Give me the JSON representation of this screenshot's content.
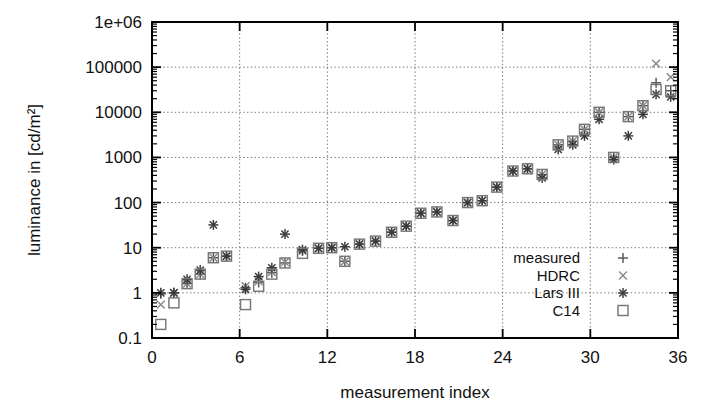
{
  "chart_data": {
    "type": "scatter",
    "title": "",
    "xlabel": "measurement index",
    "ylabel": "luminance in [cd/m²]",
    "xlim": [
      0,
      36
    ],
    "ylim": [
      0.1,
      1000000
    ],
    "yscale": "log",
    "xscale": "linear",
    "xticks": [
      0,
      6,
      12,
      18,
      24,
      30,
      36
    ],
    "xticklabels": [
      "0",
      "6",
      "12",
      "18",
      "24",
      "30",
      "36"
    ],
    "yticks": [
      0.1,
      1,
      10,
      100,
      1000,
      10000,
      100000,
      1000000
    ],
    "yticklabels": [
      "0.1",
      "1",
      "10",
      "100",
      "1000",
      "10000",
      "100000",
      "1e+06"
    ],
    "grid": true,
    "grid_style": "dotted",
    "legend_position": "lower-right-inside",
    "series": [
      {
        "name": "measured",
        "marker": "plus",
        "color": "#555555",
        "x": [
          0.6,
          1.5,
          2.4,
          3.3,
          4.2,
          5.1,
          6.4,
          7.3,
          8.2,
          9.1,
          10.3,
          11.4,
          12.3,
          13.2,
          14.2,
          15.3,
          16.4,
          17.4,
          18.4,
          19.5,
          20.6,
          21.6,
          22.6,
          23.6,
          24.7,
          25.7,
          26.7,
          27.8,
          28.8,
          29.6,
          30.6,
          31.6,
          32.6,
          33.6,
          34.5,
          35.5
        ],
        "y": [
          0.95,
          1.0,
          1.6,
          2.6,
          6.0,
          6.5,
          1.3,
          1.7,
          2.8,
          4.6,
          8.5,
          9.7,
          10.0,
          5.0,
          12.0,
          14.0,
          22.0,
          30.0,
          58.0,
          62.0,
          40.0,
          100.0,
          110.0,
          220.0,
          500.0,
          560.0,
          420.0,
          1900.0,
          2300.0,
          4200.0,
          10000.0,
          1000.0,
          8000.0,
          14000.0,
          45000.0,
          30000.0
        ]
      },
      {
        "name": "HDRC",
        "marker": "cross",
        "color": "#8a8a8a",
        "x": [
          0.6,
          1.5,
          2.4,
          3.3,
          4.2,
          5.1,
          6.4,
          7.3,
          8.2,
          9.1,
          10.3,
          11.4,
          12.3,
          13.2,
          14.2,
          15.3,
          16.4,
          17.4,
          18.4,
          19.5,
          20.6,
          21.6,
          22.6,
          23.6,
          24.7,
          25.7,
          26.7,
          27.8,
          28.8,
          29.6,
          30.6,
          31.6,
          32.6,
          33.6,
          34.5,
          35.5
        ],
        "y": [
          0.55,
          1.0,
          1.6,
          2.6,
          6.0,
          6.5,
          1.4,
          1.8,
          2.9,
          4.8,
          8.5,
          9.7,
          10.0,
          5.0,
          12.0,
          14.0,
          22.0,
          30.0,
          58.0,
          62.0,
          40.0,
          100.0,
          110.0,
          220.0,
          500.0,
          560.0,
          420.0,
          1900.0,
          2300.0,
          4200.0,
          10000.0,
          1000.0,
          8000.0,
          14000.0,
          120000.0,
          60000.0
        ]
      },
      {
        "name": "Lars III",
        "marker": "star",
        "color": "#3a3a3a",
        "x": [
          0.6,
          1.5,
          2.4,
          3.3,
          4.2,
          5.1,
          6.4,
          7.3,
          8.2,
          9.1,
          10.3,
          11.4,
          12.3,
          13.2,
          14.2,
          15.3,
          16.4,
          17.4,
          18.4,
          19.5,
          20.6,
          21.6,
          22.6,
          23.6,
          24.7,
          25.7,
          26.7,
          27.8,
          28.8,
          29.6,
          30.6,
          31.6,
          32.6,
          33.6,
          34.5,
          35.5
        ],
        "y": [
          1.0,
          1.0,
          2.0,
          3.2,
          32.0,
          6.5,
          1.2,
          2.3,
          3.6,
          20.0,
          9.0,
          9.7,
          10.0,
          10.5,
          12.0,
          14.0,
          22.0,
          30.0,
          58.0,
          62.0,
          40.0,
          100.0,
          110.0,
          220.0,
          500.0,
          560.0,
          350.0,
          1500.0,
          1900.0,
          3000.0,
          7000.0,
          900.0,
          3000.0,
          9000.0,
          25000.0,
          22000.0
        ]
      },
      {
        "name": "C14",
        "marker": "square",
        "color": "#777777",
        "x": [
          0.6,
          1.5,
          2.4,
          3.3,
          4.2,
          5.1,
          6.4,
          7.3,
          8.2,
          9.1,
          10.3,
          11.4,
          12.3,
          13.2,
          14.2,
          15.3,
          16.4,
          17.4,
          18.4,
          19.5,
          20.6,
          21.6,
          22.6,
          23.6,
          24.7,
          25.7,
          26.7,
          27.8,
          28.8,
          29.6,
          30.6,
          31.6,
          32.6,
          33.6,
          34.5,
          35.5
        ],
        "y": [
          0.2,
          0.6,
          1.6,
          2.6,
          6.0,
          6.5,
          0.55,
          1.4,
          2.6,
          4.6,
          7.5,
          9.7,
          10.0,
          5.0,
          12.0,
          14.0,
          22.0,
          30.0,
          58.0,
          62.0,
          40.0,
          100.0,
          110.0,
          220.0,
          500.0,
          560.0,
          420.0,
          1900.0,
          2300.0,
          4200.0,
          10000.0,
          1000.0,
          8000.0,
          14000.0,
          32000.0,
          30000.0
        ]
      }
    ]
  },
  "legend": {
    "entries": [
      {
        "label": "measured",
        "marker": "plus"
      },
      {
        "label": "HDRC",
        "marker": "cross"
      },
      {
        "label": "Lars III",
        "marker": "star"
      },
      {
        "label": "C14",
        "marker": "square"
      }
    ]
  }
}
